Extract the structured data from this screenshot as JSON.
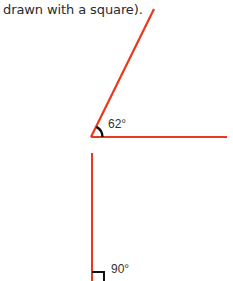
{
  "caption": "drawn with a square).",
  "figures": [
    {
      "name": "acute-angle",
      "angle_label": "62°",
      "vertex": [
        91,
        137
      ],
      "line_color": "#e8391c",
      "arc_color": "#111111"
    },
    {
      "name": "right-angle",
      "angle_label": "90°",
      "line_color": "#e8391c",
      "marker_color": "#111111"
    }
  ]
}
